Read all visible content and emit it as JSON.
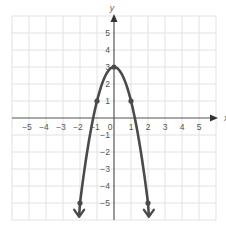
{
  "chart_data": {
    "type": "line",
    "title": "",
    "xlabel": "x",
    "ylabel": "y",
    "xlim": [
      -6,
      6
    ],
    "ylim": [
      -6,
      6
    ],
    "grid": true,
    "x_ticks": [
      "-5",
      "-4",
      "-3",
      "-2",
      "-1",
      "0",
      "1",
      "2",
      "3",
      "4",
      "5"
    ],
    "y_ticks": [
      "5",
      "4",
      "3",
      "2",
      "1",
      "-1",
      "-2",
      "-3",
      "-4",
      "-5"
    ],
    "function": "y = 3 - 2x^2",
    "series": [
      {
        "name": "parabola",
        "x": [
          -2,
          -1,
          0,
          1,
          2
        ],
        "y": [
          -5,
          1,
          3,
          1,
          -5
        ],
        "marked_points": [
          [
            -2,
            -5
          ],
          [
            -1,
            1
          ],
          [
            0,
            3
          ],
          [
            1,
            1
          ],
          [
            2,
            -5
          ]
        ],
        "arrows_at_ends": true
      }
    ],
    "colors": {
      "curve": "#4a4a4a",
      "axis": "#555555",
      "grid": "#e2e2e2"
    }
  }
}
